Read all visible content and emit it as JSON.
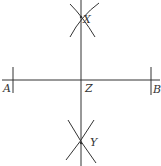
{
  "diagram": {
    "type": "perpendicular-bisector-construction",
    "stroke_color": "#333333",
    "background": "#ffffff",
    "points": {
      "A": {
        "label": "A",
        "x": 13,
        "y": 80
      },
      "B": {
        "label": "B",
        "x": 151,
        "y": 80
      },
      "Z": {
        "label": "Z",
        "x": 81,
        "y": 80
      },
      "X": {
        "label": "X",
        "x": 81,
        "y": 17
      },
      "Y": {
        "label": "Y",
        "x": 81,
        "y": 143
      }
    },
    "segments": [
      {
        "name": "line-AB",
        "from": [
          2,
          80
        ],
        "to": [
          160,
          80
        ]
      },
      {
        "name": "bisector-XY",
        "from": [
          81,
          0
        ],
        "to": [
          81,
          166
        ]
      }
    ]
  }
}
